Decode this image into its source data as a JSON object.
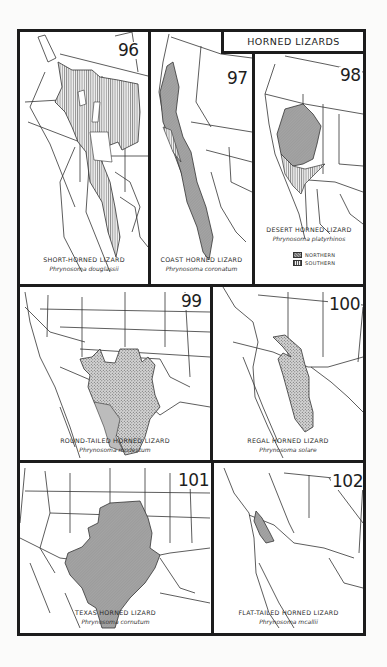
{
  "page": {
    "heading": "HORNED LIZARDS",
    "background": "#fbfbfa",
    "line_color": "#1c1c1c",
    "range_fill_color": "#9a9a9a"
  },
  "maps": [
    {
      "number": "96",
      "common_name": "SHORT-HORNED LIZARD",
      "scientific_name": "Phrynosoma douglassii",
      "pattern": "vertical-hatch"
    },
    {
      "number": "97",
      "common_name": "COAST HORNED LIZARD",
      "scientific_name": "Phrynosoma coronatum",
      "pattern": "gray-fill"
    },
    {
      "number": "98",
      "common_name": "DESERT HORNED LIZARD",
      "scientific_name": "Phrynosoma platyrhinos",
      "pattern": "gray-fill + vertical-hatch",
      "legend": [
        {
          "label": "NORTHERN",
          "pattern": "gray-fill"
        },
        {
          "label": "SOUTHERN",
          "pattern": "vertical-hatch"
        }
      ]
    },
    {
      "number": "99",
      "common_name": "ROUND-TAILED HORNED LIZARD",
      "scientific_name": "Phrynosoma modestum",
      "pattern": "stipple"
    },
    {
      "number": "100",
      "common_name": "REGAL HORNED LIZARD",
      "scientific_name": "Phrynosoma solare",
      "pattern": "stipple"
    },
    {
      "number": "101",
      "common_name": "TEXAS HORNED LIZARD",
      "scientific_name": "Phrynosoma cornutum",
      "pattern": "gray-fill"
    },
    {
      "number": "102",
      "common_name": "FLAT-TAILED HORNED LIZARD",
      "scientific_name": "Phrynosoma mcallii",
      "pattern": "gray-fill"
    }
  ]
}
